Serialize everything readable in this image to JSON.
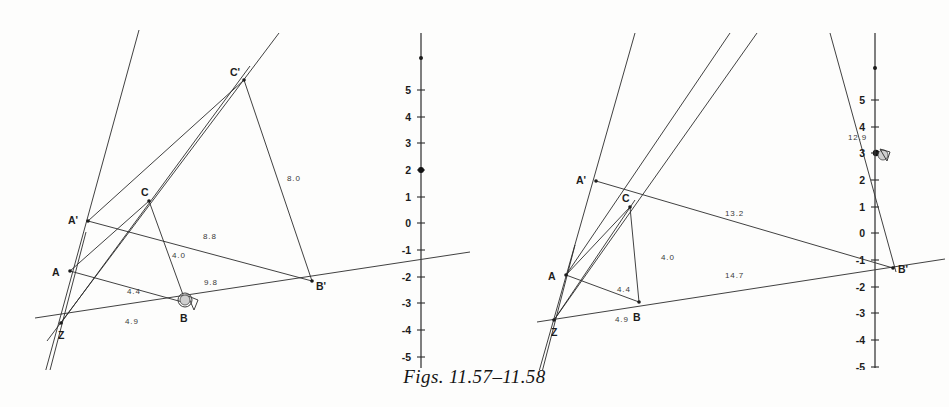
{
  "caption": "Figs. 11.57–11.58",
  "figures": [
    {
      "id": "fig-11-57",
      "name": "figure-left",
      "points": [
        {
          "label": "A'",
          "x": 88,
          "y": 221,
          "lx": 68,
          "ly": 219
        },
        {
          "label": "A",
          "x": 70,
          "y": 271,
          "lx": 52,
          "ly": 273
        },
        {
          "label": "Z",
          "x": 61,
          "y": 323,
          "lx": 58,
          "ly": 337
        },
        {
          "label": "B",
          "x": 186,
          "y": 303,
          "lx": 180,
          "ly": 320
        },
        {
          "label": "C",
          "x": 149,
          "y": 201,
          "lx": 141,
          "ly": 193
        },
        {
          "label": "C'",
          "x": 244,
          "y": 80,
          "lx": 230,
          "ly": 74
        },
        {
          "label": "B'",
          "x": 312,
          "y": 281,
          "lx": 316,
          "ly": 287
        }
      ],
      "length_labels": [
        {
          "text": "8.0",
          "x": 287,
          "y": 181
        },
        {
          "text": "8.8",
          "x": 203,
          "y": 239
        },
        {
          "text": "4.0",
          "x": 172,
          "y": 258
        },
        {
          "text": "9.8",
          "x": 204,
          "y": 285
        },
        {
          "text": "4.4",
          "x": 127,
          "y": 294
        },
        {
          "text": "4.9",
          "x": 125,
          "y": 324
        }
      ],
      "axis": {
        "x": 421,
        "y_top": 33,
        "y_bottom": 368,
        "origin_y": 223,
        "unit_px": 26.7,
        "ticks": [
          "5",
          "4",
          "3",
          "2",
          "1",
          "0",
          "-1",
          "-2",
          "-3",
          "-4",
          "-5"
        ],
        "tick_values": [
          5,
          4,
          3,
          2,
          1,
          0,
          -1,
          -2,
          -3,
          -4,
          -5
        ],
        "marked_values": [
          2,
          6.2
        ]
      }
    },
    {
      "id": "fig-11-58",
      "name": "figure-right",
      "points": [
        {
          "label": "A'",
          "x": 121,
          "y": 181,
          "lx": 101,
          "ly": 179
        },
        {
          "label": "A",
          "x": 91,
          "y": 275,
          "lx": 73,
          "ly": 277
        },
        {
          "label": "Z",
          "x": 79,
          "y": 320,
          "lx": 76,
          "ly": 335
        },
        {
          "label": "B",
          "x": 164,
          "y": 302,
          "lx": 158,
          "ly": 318
        },
        {
          "label": "C",
          "x": 155,
          "y": 207,
          "lx": 147,
          "ly": 199
        },
        {
          "label": "B'",
          "x": 418,
          "y": 268,
          "lx": 423,
          "ly": 270
        }
      ],
      "length_labels": [
        {
          "text": "12.9",
          "x": 383,
          "y": 137
        },
        {
          "text": "13.2",
          "x": 250,
          "y": 216
        },
        {
          "text": "4.0",
          "x": 186,
          "y": 260
        },
        {
          "text": "14.7",
          "x": 250,
          "y": 278
        },
        {
          "text": "4.4",
          "x": 142,
          "y": 292
        },
        {
          "text": "4.9",
          "x": 140,
          "y": 322
        }
      ],
      "axis": {
        "x": 400,
        "y_top": 33,
        "y_bottom": 368,
        "origin_y": 233,
        "unit_px": 26.7,
        "ticks": [
          "5",
          "4",
          "3",
          "2",
          "1",
          "0",
          "-1",
          "-2",
          "-3",
          "-4",
          "-5"
        ],
        "tick_values": [
          5,
          4,
          3,
          2,
          1,
          0,
          -1,
          -2,
          -3,
          -4,
          -5
        ],
        "marked_values": [
          3,
          6.2
        ]
      }
    }
  ]
}
